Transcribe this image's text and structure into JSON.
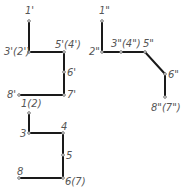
{
  "diagram": {
    "front_view": {
      "points": [
        {
          "id": "1'",
          "label": "1'",
          "x": 29,
          "y": 21
        },
        {
          "id": "3'",
          "label": "3'(2')",
          "x": 29,
          "y": 52
        },
        {
          "id": "5'",
          "label": "5'(4')",
          "x": 64,
          "y": 52
        },
        {
          "id": "6'",
          "label": "6'",
          "x": 64,
          "y": 72
        },
        {
          "id": "7'",
          "label": "7'",
          "x": 64,
          "y": 95
        },
        {
          "id": "8'",
          "label": "8'",
          "x": 19,
          "y": 95
        }
      ]
    },
    "side_view": {
      "points": [
        {
          "id": "1\"",
          "label": "1\"",
          "x": 102,
          "y": 21
        },
        {
          "id": "2\"",
          "label": "2\"",
          "x": 102,
          "y": 52
        },
        {
          "id": "3\"",
          "label": "3\"(4\")",
          "x": 121,
          "y": 52
        },
        {
          "id": "5\"",
          "label": "5\"",
          "x": 145,
          "y": 52
        },
        {
          "id": "6\"",
          "label": "6\"",
          "x": 165,
          "y": 74
        },
        {
          "id": "8\"",
          "label": "8\"(7\")",
          "x": 165,
          "y": 97
        }
      ]
    },
    "top_view": {
      "points": [
        {
          "id": "1",
          "label": "1(2)",
          "x": 29,
          "y": 113
        },
        {
          "id": "3",
          "label": "3",
          "x": 29,
          "y": 133
        },
        {
          "id": "4",
          "label": "4",
          "x": 63,
          "y": 133
        },
        {
          "id": "5",
          "label": "5",
          "x": 63,
          "y": 155
        },
        {
          "id": "6",
          "label": "6(7)",
          "x": 63,
          "y": 178
        },
        {
          "id": "8",
          "label": "8",
          "x": 19,
          "y": 178
        }
      ]
    }
  }
}
